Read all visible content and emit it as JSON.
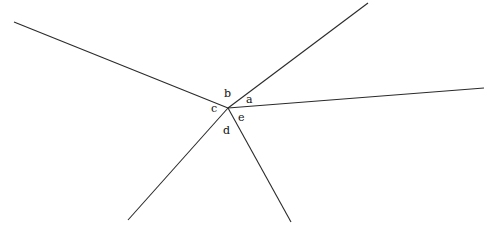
{
  "diagram": {
    "width": 492,
    "height": 240,
    "center": {
      "x": 228,
      "y": 108
    },
    "line_color": "#2a2a2a",
    "label_color": "#111111",
    "rays": [
      {
        "id": "upper-left",
        "x2": 14,
        "y2": 22
      },
      {
        "id": "upper-right",
        "x2": 368,
        "y2": 3
      },
      {
        "id": "right",
        "x2": 484,
        "y2": 88
      },
      {
        "id": "lower-left",
        "x2": 128,
        "y2": 220
      },
      {
        "id": "lower",
        "x2": 291,
        "y2": 222
      }
    ],
    "labels": [
      {
        "id": "a",
        "text": "a",
        "x": 246,
        "y": 103
      },
      {
        "id": "b",
        "text": "b",
        "x": 224,
        "y": 97
      },
      {
        "id": "c",
        "text": "c",
        "x": 211,
        "y": 112
      },
      {
        "id": "d",
        "text": "d",
        "x": 223,
        "y": 134
      },
      {
        "id": "e",
        "text": "e",
        "x": 238,
        "y": 121
      }
    ]
  }
}
